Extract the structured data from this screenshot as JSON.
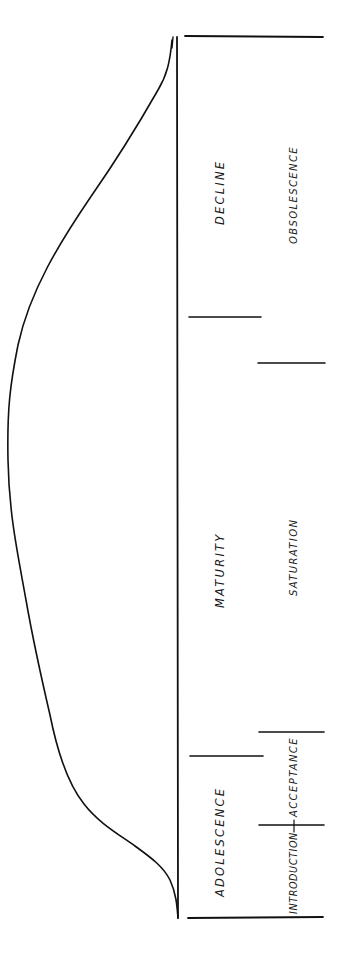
{
  "diagram": {
    "orientation": "rotated-90-ccw",
    "ink_color": "#111111",
    "background": "#ffffff",
    "curve": {
      "name": "sales-curve",
      "shape": "bell / s-rise then decline",
      "description": "Starts at zero at introduction, rises through adolescence, peaks in maturity, declines to zero at obsolescence"
    },
    "primary_stages": [
      {
        "id": "adolescence",
        "label": "Adolescence"
      },
      {
        "id": "maturity",
        "label": "Maturity"
      },
      {
        "id": "decline",
        "label": "Decline"
      }
    ],
    "secondary_stages": [
      {
        "id": "introduction",
        "label": "Introduction"
      },
      {
        "id": "acceptance",
        "label": "Acceptance"
      },
      {
        "id": "saturation",
        "label": "Saturation"
      },
      {
        "id": "obsolescence",
        "label": "Obsolescence"
      }
    ]
  }
}
